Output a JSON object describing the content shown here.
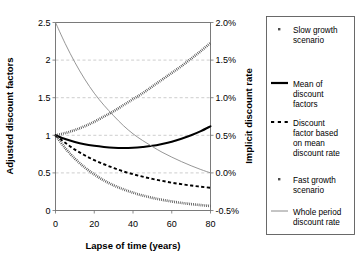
{
  "chart_data": {
    "type": "line",
    "title": "",
    "xlabel": "Lapse of time (years)",
    "ylabel": "Adjusted discount factors",
    "y2label": "Implicit discount rate",
    "xlim": [
      0,
      80
    ],
    "ylim": [
      0,
      2.5
    ],
    "y2lim": [
      -0.5,
      2.0
    ],
    "xticks": [
      "0",
      "20",
      "40",
      "60",
      "80"
    ],
    "xtick_values": [
      0,
      20,
      40,
      60,
      80
    ],
    "yticks": [
      "0",
      "0.5",
      "1",
      "1.5",
      "2",
      "2.5"
    ],
    "ytick_values": [
      0,
      0.5,
      1,
      1.5,
      2,
      2.5
    ],
    "y2ticks": [
      "-0.5%",
      "0.0%",
      "0.5%",
      "1.0%",
      "1.5%",
      "2.0%"
    ],
    "y2tick_values": [
      -0.5,
      0.0,
      0.5,
      1.0,
      1.5,
      2.0
    ],
    "grid": true,
    "legend_position": "right-outside",
    "x": [
      0,
      5,
      10,
      15,
      20,
      25,
      30,
      35,
      40,
      45,
      50,
      55,
      60,
      65,
      70,
      75,
      80
    ],
    "series": [
      {
        "name": "Slow growth scenario",
        "axis": "left",
        "style": "thick-stippled",
        "color": "#4d4d4d",
        "values": [
          1.0,
          1.03,
          1.07,
          1.12,
          1.18,
          1.25,
          1.32,
          1.4,
          1.48,
          1.56,
          1.65,
          1.74,
          1.83,
          1.92,
          2.02,
          2.12,
          2.23
        ]
      },
      {
        "name": "Mean of discount factors",
        "axis": "left",
        "style": "thick-solid",
        "color": "#000000",
        "values": [
          1.0,
          0.95,
          0.91,
          0.88,
          0.86,
          0.845,
          0.835,
          0.832,
          0.835,
          0.845,
          0.86,
          0.885,
          0.915,
          0.955,
          1.0,
          1.055,
          1.12
        ]
      },
      {
        "name": "Discount factor based on mean discount rate",
        "axis": "left",
        "style": "dashed",
        "color": "#000000",
        "values": [
          1.0,
          0.9,
          0.81,
          0.735,
          0.67,
          0.615,
          0.565,
          0.52,
          0.483,
          0.45,
          0.42,
          0.394,
          0.37,
          0.35,
          0.332,
          0.316,
          0.302
        ]
      },
      {
        "name": "Fast growth scenario",
        "axis": "left",
        "style": "thick-stippled",
        "color": "#4d4d4d",
        "values": [
          1.0,
          0.83,
          0.69,
          0.575,
          0.48,
          0.4,
          0.335,
          0.282,
          0.237,
          0.2,
          0.168,
          0.142,
          0.12,
          0.101,
          0.085,
          0.072,
          0.06
        ]
      },
      {
        "name": "Whole period discount rate",
        "axis": "right",
        "style": "thin-solid",
        "color": "#8a8a8a",
        "values": [
          2.0,
          1.72,
          1.47,
          1.25,
          1.06,
          0.9,
          0.76,
          0.63,
          0.52,
          0.43,
          0.35,
          0.275,
          0.21,
          0.15,
          0.095,
          0.045,
          0.0
        ]
      }
    ],
    "legend": [
      {
        "label_line1": "Slow growth",
        "label_line2": "scenario",
        "marker": "dotted-small",
        "color": "#4d4d4d"
      },
      {
        "label_line1": "Mean of",
        "label_line2": "discount",
        "label_line3": "factors",
        "marker": "thick-solid",
        "color": "#000000"
      },
      {
        "label_line1": "Discount",
        "label_line2": "factor based",
        "label_line3": "on mean",
        "label_line4": "discount rate",
        "marker": "dashed",
        "color": "#000000"
      },
      {
        "label_line1": "Fast growth",
        "label_line2": "scenario",
        "marker": "dotted-small",
        "color": "#4d4d4d"
      },
      {
        "label_line1": "Whole period",
        "label_line2": "discount rate",
        "marker": "thin-solid",
        "color": "#8a8a8a"
      }
    ]
  }
}
